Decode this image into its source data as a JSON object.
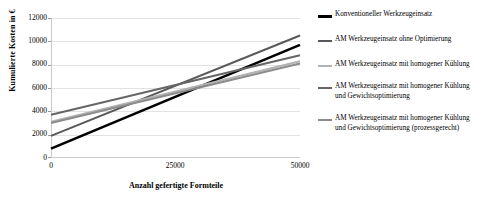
{
  "chart_data": {
    "type": "line",
    "title": "",
    "xlabel": "Anzahl gefertigte Formteile",
    "ylabel": "Kumulierte Kosten in €",
    "xlim": [
      0,
      50000
    ],
    "ylim": [
      0,
      12000
    ],
    "xticks": [
      0,
      25000,
      50000
    ],
    "xtick_labels": [
      "0",
      "25000",
      "50000"
    ],
    "yticks": [
      0,
      2000,
      4000,
      6000,
      8000,
      10000,
      12000
    ],
    "ytick_labels": [
      "0",
      "2000",
      "4000",
      "6000",
      "8000",
      "10000",
      "12000"
    ],
    "grid": "horizontal",
    "legend_position": "right",
    "x": [
      0,
      50000
    ],
    "series": [
      {
        "name": "Konventioneller Werkzeugeinsatz",
        "color": "#000000",
        "width": 2.6,
        "values": [
          800,
          9700
        ]
      },
      {
        "name": "AM Werkzeugeinsatz ohne Optimierung",
        "color": "#595959",
        "width": 2.0,
        "values": [
          1900,
          10500
        ]
      },
      {
        "name": "AM Werkzeugeinsatz mit homogener Kühlung",
        "color": "#b3b3b3",
        "width": 2.0,
        "values": [
          3100,
          8300
        ]
      },
      {
        "name": "AM Werkzeugeinsatz mit homogener Kühlung\nund Gewichtsoptimierung",
        "color": "#666666",
        "width": 2.0,
        "values": [
          3700,
          8800
        ]
      },
      {
        "name": "AM Werkzeugeinsatz mit homogener Kühlung\nund Gewichtsoptimierung (prozessgerecht)",
        "color": "#8c8c8c",
        "width": 2.0,
        "values": [
          3000,
          8100
        ]
      }
    ]
  },
  "axes": {
    "y_title": "Kumulierte Kosten in €",
    "x_title": "Anzahl gefertigte Formteile",
    "y_labels": [
      "12000",
      "10000",
      "8000",
      "6000",
      "4000",
      "2000",
      "0"
    ],
    "x_labels": [
      "0",
      "25000",
      "50000"
    ]
  },
  "legend": {
    "items": [
      {
        "label": "Konventioneller Werkzeugeinsatz"
      },
      {
        "label": "AM Werkzeugeinsatz ohne Optimierung"
      },
      {
        "label": "AM Werkzeugeinsatz mit homogener Kühlung"
      },
      {
        "label": "AM Werkzeugeinsatz mit homogener Kühlung\nund Gewichtsoptimierung"
      },
      {
        "label": "AM Werkzeugeinsatz mit homogener Kühlung\nund Gewichtsoptimierung (prozessgerecht)"
      }
    ]
  }
}
